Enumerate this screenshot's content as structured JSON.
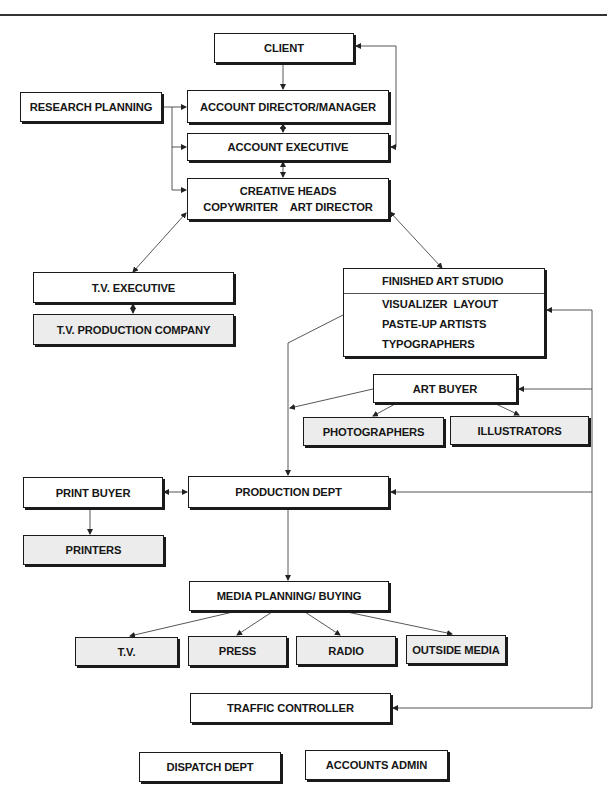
{
  "diagram": {
    "colors": {
      "line": "#333333",
      "box_border": "#1a1a1a",
      "shaded_fill": "#ececec",
      "plain_fill": "#ffffff"
    },
    "boxes": {
      "client": "CLIENT",
      "research_planning": "RESEARCH PLANNING",
      "account_director": "ACCOUNT DIRECTOR/MANAGER",
      "account_executive": "ACCOUNT EXECUTIVE",
      "creative_heads": {
        "line1": "CREATIVE HEADS",
        "line2": "COPYWRITER    ART DIRECTOR"
      },
      "tv_executive": "T.V. EXECUTIVE",
      "tv_production_company": "T.V. PRODUCTION COMPANY",
      "finished_art_studio": {
        "header": "FINISHED ART STUDIO",
        "rows": [
          "VISUALIZER  LAYOUT",
          "PASTE-UP ARTISTS",
          "TYPOGRAPHERS"
        ]
      },
      "art_buyer": "ART BUYER",
      "photographers": "PHOTOGRAPHERS",
      "illustrators": "ILLUSTRATORS",
      "print_buyer": "PRINT BUYER",
      "production_dept": "PRODUCTION DEPT",
      "printers": "PRINTERS",
      "media_planning": "MEDIA PLANNING/ BUYING",
      "media_tv": "T.V.",
      "media_press": "PRESS",
      "media_radio": "RADIO",
      "media_outside": "OUTSIDE MEDIA",
      "traffic_controller": "TRAFFIC CONTROLLER",
      "dispatch_dept": "DISPATCH DEPT",
      "accounts_admin": "ACCOUNTS ADMIN"
    },
    "edges": [
      {
        "from": "client",
        "to": "account_director",
        "type": "arrow"
      },
      {
        "from": "account_executive",
        "to": "client",
        "type": "loop-right",
        "bidirectional": true
      },
      {
        "from": "research_planning",
        "to": "account_director",
        "type": "arrow"
      },
      {
        "from": "research_planning",
        "to": "account_executive",
        "type": "arrow"
      },
      {
        "from": "research_planning",
        "to": "creative_heads",
        "type": "arrow"
      },
      {
        "from": "account_director",
        "to": "account_executive",
        "type": "bidirectional"
      },
      {
        "from": "account_executive",
        "to": "creative_heads",
        "type": "bidirectional"
      },
      {
        "from": "creative_heads",
        "to": "tv_executive",
        "type": "bidirectional"
      },
      {
        "from": "creative_heads",
        "to": "finished_art_studio",
        "type": "bidirectional"
      },
      {
        "from": "tv_executive",
        "to": "tv_production_company",
        "type": "bidirectional"
      },
      {
        "from": "finished_art_studio",
        "to": "production_dept",
        "type": "arrow"
      },
      {
        "from": "art_buyer",
        "to": "production_dept",
        "type": "arrow"
      },
      {
        "from": "art_buyer",
        "to": "photographers",
        "type": "arrow"
      },
      {
        "from": "art_buyer",
        "to": "illustrators",
        "type": "arrow"
      },
      {
        "from": "print_buyer",
        "to": "production_dept",
        "type": "bidirectional"
      },
      {
        "from": "print_buyer",
        "to": "printers",
        "type": "arrow"
      },
      {
        "from": "production_dept",
        "to": "media_planning",
        "type": "arrow"
      },
      {
        "from": "media_planning",
        "to": "media_tv",
        "type": "arrow"
      },
      {
        "from": "media_planning",
        "to": "media_press",
        "type": "arrow"
      },
      {
        "from": "media_planning",
        "to": "media_radio",
        "type": "arrow"
      },
      {
        "from": "media_planning",
        "to": "media_outside",
        "type": "arrow"
      },
      {
        "from": "right_bus",
        "to": "finished_art_studio",
        "type": "arrow"
      },
      {
        "from": "right_bus",
        "to": "art_buyer",
        "type": "arrow"
      },
      {
        "from": "right_bus",
        "to": "production_dept",
        "type": "arrow"
      },
      {
        "from": "right_bus",
        "to": "traffic_controller",
        "type": "arrow"
      }
    ]
  }
}
